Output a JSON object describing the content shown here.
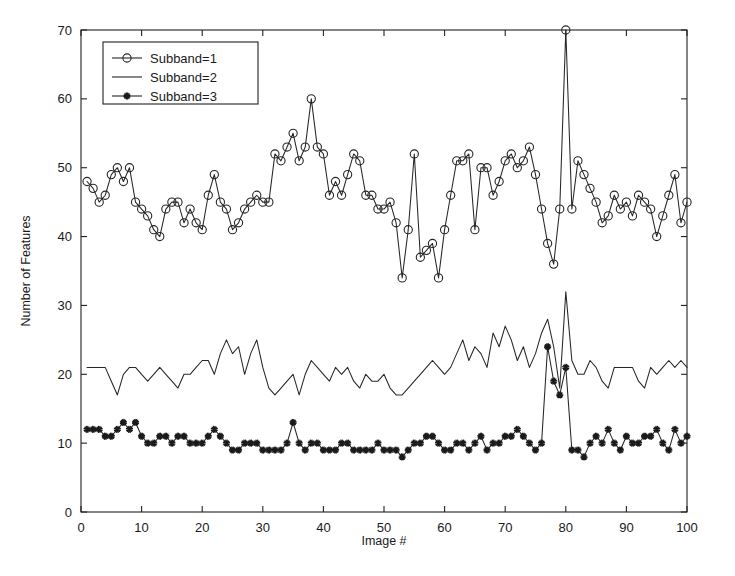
{
  "chart_data": {
    "type": "line",
    "title": "",
    "xlabel": "Image #",
    "ylabel": "Number of Features",
    "xlim": [
      0,
      100
    ],
    "ylim": [
      0,
      70
    ],
    "xticks": [
      0,
      10,
      20,
      30,
      40,
      50,
      60,
      70,
      80,
      90,
      100
    ],
    "yticks": [
      0,
      10,
      20,
      30,
      40,
      50,
      60,
      70
    ],
    "xticklabels": [
      "0",
      "10",
      "20",
      "30",
      "40",
      "50",
      "60",
      "70",
      "80",
      "90",
      "100"
    ],
    "yticklabels": [
      "0",
      "10",
      "20",
      "30",
      "40",
      "50",
      "60",
      "70"
    ],
    "grid": false,
    "legend_position": "upper left",
    "legend_entries": [
      "Subband=1",
      "Subband=2",
      "Subband=3"
    ],
    "line_color": "#262626",
    "x": [
      1,
      2,
      3,
      4,
      5,
      6,
      7,
      8,
      9,
      10,
      11,
      12,
      13,
      14,
      15,
      16,
      17,
      18,
      19,
      20,
      21,
      22,
      23,
      24,
      25,
      26,
      27,
      28,
      29,
      30,
      31,
      32,
      33,
      34,
      35,
      36,
      37,
      38,
      39,
      40,
      41,
      42,
      43,
      44,
      45,
      46,
      47,
      48,
      49,
      50,
      51,
      52,
      53,
      54,
      55,
      56,
      57,
      58,
      59,
      60,
      61,
      62,
      63,
      64,
      65,
      66,
      67,
      68,
      69,
      70,
      71,
      72,
      73,
      74,
      75,
      76,
      77,
      78,
      79,
      80,
      81,
      82,
      83,
      84,
      85,
      86,
      87,
      88,
      89,
      90,
      91,
      92,
      93,
      94,
      95,
      96,
      97,
      98,
      99,
      100
    ],
    "series": [
      {
        "name": "Subband=1",
        "marker": "circle",
        "values": [
          48,
          47,
          45,
          46,
          49,
          50,
          48,
          50,
          45,
          44,
          43,
          41,
          40,
          44,
          45,
          45,
          42,
          44,
          42,
          41,
          46,
          49,
          45,
          44,
          41,
          42,
          44,
          45,
          46,
          45,
          45,
          52,
          51,
          53,
          55,
          51,
          53,
          60,
          53,
          52,
          46,
          48,
          46,
          49,
          52,
          51,
          46,
          46,
          44,
          44,
          45,
          42,
          34,
          41,
          52,
          37,
          38,
          39,
          34,
          41,
          46,
          51,
          51,
          52,
          41,
          50,
          50,
          46,
          48,
          51,
          52,
          50,
          51,
          53,
          49,
          44,
          39,
          36,
          44,
          70,
          44,
          51,
          49,
          47,
          45,
          42,
          43,
          46,
          44,
          45,
          43,
          46,
          45,
          44,
          40,
          43,
          46,
          49,
          42,
          45
        ]
      },
      {
        "name": "Subband=2",
        "marker": "none",
        "values": [
          21,
          21,
          21,
          21,
          19,
          17,
          20,
          21,
          21,
          20,
          19,
          20,
          21,
          20,
          19,
          18,
          20,
          20,
          21,
          22,
          22,
          20,
          23,
          25,
          23,
          24,
          20,
          23,
          25,
          21,
          18,
          17,
          18,
          19,
          20,
          17,
          20,
          22,
          21,
          20,
          19,
          21,
          20,
          21,
          19,
          18,
          20,
          19,
          19,
          20,
          18,
          17,
          17,
          18,
          19,
          20,
          21,
          22,
          21,
          20,
          21,
          23,
          25,
          22,
          24,
          23,
          21,
          26,
          24,
          27,
          25,
          22,
          24,
          21,
          23,
          26,
          28,
          24,
          18,
          32,
          22,
          20,
          20,
          22,
          21,
          19,
          18,
          21,
          21,
          21,
          21,
          19,
          18,
          21,
          20,
          21,
          22,
          21,
          22,
          21
        ]
      },
      {
        "name": "Subband=3",
        "marker": "star",
        "values": [
          12,
          12,
          12,
          11,
          11,
          12,
          13,
          12,
          13,
          11,
          10,
          10,
          11,
          11,
          10,
          11,
          11,
          10,
          10,
          10,
          11,
          12,
          11,
          10,
          9,
          9,
          10,
          10,
          10,
          9,
          9,
          9,
          9,
          10,
          13,
          10,
          9,
          10,
          10,
          9,
          9,
          9,
          10,
          10,
          9,
          9,
          9,
          9,
          10,
          9,
          9,
          9,
          8,
          9,
          10,
          10,
          11,
          11,
          10,
          9,
          9,
          10,
          10,
          9,
          10,
          11,
          9,
          10,
          10,
          11,
          11,
          12,
          11,
          10,
          9,
          10,
          24,
          19,
          17,
          21,
          9,
          9,
          8,
          10,
          11,
          10,
          12,
          10,
          9,
          11,
          10,
          10,
          11,
          11,
          12,
          10,
          9,
          12,
          10,
          11
        ]
      }
    ]
  },
  "axes": {
    "x_title": "Image #",
    "y_title": "Number of Features"
  },
  "legend": {
    "items": [
      {
        "label": "Subband=1",
        "marker": "circle"
      },
      {
        "label": "Subband=2",
        "marker": "line"
      },
      {
        "label": "Subband=3",
        "marker": "star"
      }
    ]
  }
}
